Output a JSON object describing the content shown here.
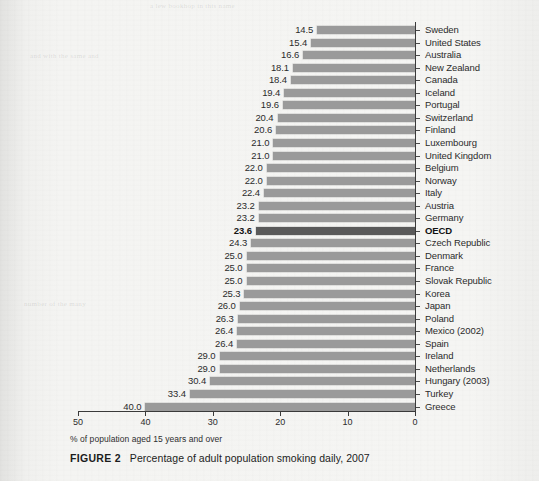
{
  "chart_data": {
    "type": "bar",
    "orientation": "horizontal",
    "title": "Percentage of adult population smoking daily, 2007",
    "figure_number": "FIGURE 2",
    "xlabel": "% of population aged 15 years and over",
    "ylabel": "",
    "xlim": [
      50,
      0
    ],
    "x_axis_reversed": true,
    "xticks": [
      50,
      40,
      30,
      20,
      10,
      0
    ],
    "xticklabels": [
      "50",
      "40",
      "30",
      "20",
      "10",
      "0"
    ],
    "grid": false,
    "legend": null,
    "bar_color": "#9a9a9a",
    "highlight_color": "#5a5a5a",
    "highlight_category": "OECD",
    "value_labels_shown": true,
    "categories": [
      "Sweden",
      "United States",
      "Australia",
      "New Zealand",
      "Canada",
      "Iceland",
      "Portugal",
      "Switzerland",
      "Finland",
      "Luxembourg",
      "United Kingdom",
      "Belgium",
      "Norway",
      "Italy",
      "Austria",
      "Germany",
      "OECD",
      "Czech Republic",
      "Denmark",
      "France",
      "Slovak Republic",
      "Korea",
      "Japan",
      "Poland",
      "Mexico (2002)",
      "Spain",
      "Ireland",
      "Netherlands",
      "Hungary (2003)",
      "Turkey",
      "Greece"
    ],
    "values": [
      14.5,
      15.4,
      16.6,
      18.1,
      18.4,
      19.4,
      19.6,
      20.4,
      20.6,
      21.0,
      21.0,
      22.0,
      22.0,
      22.4,
      23.2,
      23.2,
      23.6,
      24.3,
      25.0,
      25.0,
      25.0,
      25.3,
      26.0,
      26.3,
      26.4,
      26.4,
      29.0,
      29.0,
      30.4,
      33.4,
      40.0
    ],
    "value_label_texts": [
      "14.5",
      "15.4",
      "16.6",
      "18.1",
      "18.4",
      "19.4",
      "19.6",
      "20.4",
      "20.6",
      "21.0",
      "21.0",
      "22.0",
      "22.0",
      "22.4",
      "23.2",
      "23.2",
      "23.6",
      "24.3",
      "25.0",
      "25.0",
      "25.0",
      "25.3",
      "26.0",
      "26.3",
      "26.4",
      "26.4",
      "29.0",
      "29.0",
      "30.4",
      "33.4",
      "40.0"
    ]
  },
  "page": {
    "ghost_text": [
      "a lew bookhop in this name",
      "and with the same and",
      "number of the many"
    ]
  }
}
